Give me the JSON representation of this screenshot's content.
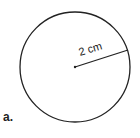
{
  "figure": {
    "label": "a.",
    "circle": {
      "cx": 75,
      "cy": 67,
      "r": 55,
      "stroke": "#222222"
    },
    "radius_line": {
      "x1": 75,
      "y1": 67,
      "x2": 128,
      "y2": 50
    },
    "radius_label": "2 cm"
  }
}
